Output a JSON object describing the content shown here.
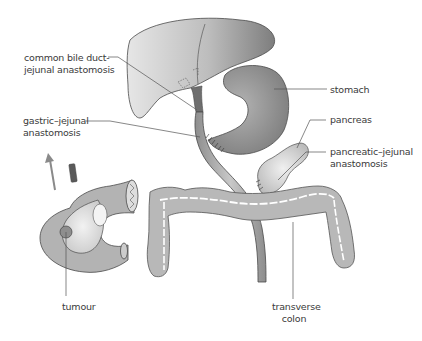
{
  "diagram": {
    "type": "anatomical illustration",
    "colors": {
      "organ_fill": "#a9a9a9",
      "organ_dark": "#8c8c8c",
      "colon_fill": "#b8b8b8",
      "specimen_fill": "#b3b3b3",
      "pancreas_fill": "#d4d4d4",
      "outline": "#4a4a4a",
      "leader_line": "#555555",
      "arrow": "#8a8a8a",
      "text": "#3a3a3a"
    },
    "labels": {
      "cbd_line1": "common bile duct-",
      "cbd_line2": "jejunal anastomosis",
      "gj_line1": "gastric–jejunal",
      "gj_line2": "anastomosis",
      "stomach": "stomach",
      "pancreas": "pancreas",
      "pj_line1": "pancreatic–jejunal",
      "pj_line2": "anastomosis",
      "tumour": "tumour",
      "colon_line1": "transverse",
      "colon_line2": "colon"
    }
  }
}
